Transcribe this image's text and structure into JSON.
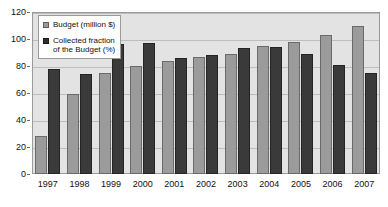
{
  "chart_data": {
    "type": "bar",
    "title": "",
    "xlabel": "",
    "ylabel": "",
    "ylim": [
      0,
      120
    ],
    "ytick_step": 20,
    "yticks": [
      "0",
      "20",
      "40",
      "60",
      "80",
      "100",
      "120"
    ],
    "grid": true,
    "legend_position": "inside-top-left",
    "categories": [
      "1997",
      "1998",
      "1999",
      "2000",
      "2001",
      "2002",
      "2003",
      "2004",
      "2005",
      "2006",
      "2007"
    ],
    "series": [
      {
        "name": "Budget (million $)",
        "color": "#9b9b9b",
        "values": [
          28,
          59,
          75,
          80,
          84,
          87,
          89,
          95,
          98,
          103,
          110
        ]
      },
      {
        "name": "Collected fraction\nof the Budget (%)",
        "color": "#3a3a3a",
        "values": [
          78,
          74,
          96,
          97,
          86,
          88,
          93,
          94,
          89,
          81,
          75
        ]
      }
    ]
  },
  "legend": {
    "entries": [
      {
        "label": "Budget (million $)",
        "swatch": "series-budget"
      },
      {
        "label": "Collected fraction\nof the Budget (%)",
        "swatch": "series-collected"
      }
    ]
  },
  "colors": {
    "plot_background": "#e3e3e3",
    "gridline": "#bdbdbd",
    "frame_border": "#9a9a9a",
    "budget_bar": "#9b9b9b",
    "collected_bar": "#3a3a3a",
    "text": "#111111",
    "page_background": "#ffffff"
  }
}
